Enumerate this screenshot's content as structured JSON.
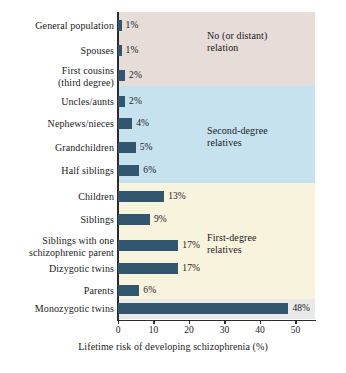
{
  "chart_data": {
    "type": "bar",
    "orientation": "horizontal",
    "title": "",
    "xlabel": "Lifetime risk of developing schizophrenia (%)",
    "ylabel": "",
    "xlim": [
      0,
      55
    ],
    "xticks": [
      0,
      10,
      20,
      30,
      40,
      50
    ],
    "xtick_labels": [
      "0",
      "10",
      "20",
      "30",
      "40",
      "50"
    ],
    "grid": false,
    "legend": "none",
    "bar_color": "#33566f",
    "categories": [
      "General population",
      "Spouses",
      "First cousins (third degree)",
      "Uncles/aunts",
      "Nephews/nieces",
      "Grandchildren",
      "Half siblings",
      "Children",
      "Siblings",
      "Siblings with one schizophrenic parent",
      "Dizygotic twins",
      "Parents",
      "Monozygotic twins"
    ],
    "values": [
      1,
      1,
      2,
      2,
      4,
      5,
      6,
      13,
      9,
      17,
      17,
      6,
      48
    ],
    "value_labels": [
      "1%",
      "1%",
      "2%",
      "2%",
      "4%",
      "5%",
      "6%",
      "13%",
      "9%",
      "17%",
      "17%",
      "6%",
      "48%"
    ],
    "bars": [
      {
        "label_line1": "General population",
        "label_line2": "",
        "value": 1,
        "value_label": "1%"
      },
      {
        "label_line1": "Spouses",
        "label_line2": "",
        "value": 1,
        "value_label": "1%"
      },
      {
        "label_line1": "First cousins",
        "label_line2": "(third degree)",
        "value": 2,
        "value_label": "2%"
      },
      {
        "label_line1": "Uncles/aunts",
        "label_line2": "",
        "value": 2,
        "value_label": "2%"
      },
      {
        "label_line1": "Nephews/nieces",
        "label_line2": "",
        "value": 4,
        "value_label": "4%"
      },
      {
        "label_line1": "Grandchildren",
        "label_line2": "",
        "value": 5,
        "value_label": "5%"
      },
      {
        "label_line1": "Half siblings",
        "label_line2": "",
        "value": 6,
        "value_label": "6%"
      },
      {
        "label_line1": "Children",
        "label_line2": "",
        "value": 13,
        "value_label": "13%"
      },
      {
        "label_line1": "Siblings",
        "label_line2": "",
        "value": 9,
        "value_label": "9%"
      },
      {
        "label_line1": "Siblings with one",
        "label_line2": "schizophrenic parent",
        "value": 17,
        "value_label": "17%"
      },
      {
        "label_line1": "Dizygotic twins",
        "label_line2": "",
        "value": 17,
        "value_label": "17%"
      },
      {
        "label_line1": "Parents",
        "label_line2": "",
        "value": 6,
        "value_label": "6%"
      },
      {
        "label_line1": "Monozygotic twins",
        "label_line2": "",
        "value": 48,
        "value_label": "48%"
      }
    ],
    "groups": [
      {
        "name": "no-relation",
        "label_line1": "No (or distant)",
        "label_line2": "relation",
        "color": "#e6dcd8"
      },
      {
        "name": "second-degree",
        "label_line1": "Second-degree",
        "label_line2": "relatives",
        "color": "#c6e2ef"
      },
      {
        "name": "first-degree",
        "label_line1": "First-degree",
        "label_line2": "relatives",
        "color": "#f8f3dd"
      },
      {
        "name": "monozygotic",
        "label_line1": "",
        "label_line2": "",
        "color": "#e9e9e9"
      }
    ]
  }
}
